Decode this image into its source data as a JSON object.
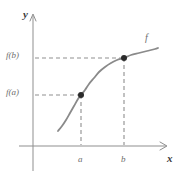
{
  "figure": {
    "kind": "math-function-graph",
    "background_color": "#ffffff"
  },
  "axes": {
    "x_label": "x",
    "y_label": "y",
    "axis_color": "#8f8f8f",
    "origin_px": [
      33,
      146
    ],
    "x_axis_end_px": [
      170,
      146
    ],
    "y_axis_top_px": [
      33,
      14
    ],
    "y_axis_bottom_px": [
      33,
      171
    ]
  },
  "curve": {
    "label": "f",
    "color": "#8a8a8a",
    "width_px": 1.8,
    "description": "increasing concave-up then concave-down S-shaped curve"
  },
  "markers": {
    "color": "#2b2b2b",
    "radius_px": 3.0
  },
  "guides": {
    "color": "#8f8f8f",
    "dash": "4 3"
  },
  "chart_data": {
    "type": "line",
    "title": "",
    "xlabel": "x",
    "ylabel": "y",
    "grid": false,
    "legend": false,
    "annotations": [
      "f",
      "f(a)",
      "f(b)",
      "a",
      "b"
    ],
    "xtick_labels": [
      "a",
      "b"
    ],
    "ytick_labels": [
      "f(a)",
      "f(b)"
    ],
    "xtick_values_px": [
      81,
      124
    ],
    "ytick_values_px": [
      95,
      58
    ],
    "points": [
      {
        "name": "point-a",
        "x_label": "a",
        "y_label": "f(a)",
        "x_px": 81,
        "y_px": 95
      },
      {
        "name": "point-b",
        "x_label": "b",
        "y_label": "f(b)",
        "x_px": 124,
        "y_px": 58
      }
    ],
    "series": [
      {
        "name": "f",
        "points_px": [
          [
            58,
            131
          ],
          [
            62,
            126
          ],
          [
            66,
            120
          ],
          [
            70,
            113
          ],
          [
            74,
            106
          ],
          [
            78,
            99
          ],
          [
            81,
            95
          ],
          [
            85,
            90
          ],
          [
            89,
            84
          ],
          [
            94,
            78
          ],
          [
            99,
            72
          ],
          [
            105,
            67
          ],
          [
            111,
            63
          ],
          [
            117,
            60
          ],
          [
            124,
            58
          ],
          [
            131,
            55
          ],
          [
            139,
            53
          ],
          [
            147,
            51
          ],
          [
            155,
            49
          ],
          [
            158,
            48
          ]
        ]
      }
    ]
  }
}
